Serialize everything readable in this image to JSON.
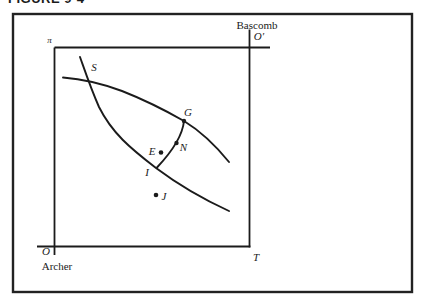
{
  "figure": {
    "caption": "FIGURE 9-4"
  },
  "colors": {
    "ink": "#1b1b1b",
    "background": "#ffffff"
  },
  "traders": {
    "top_right": "Bascomb",
    "bottom_left": "Archer"
  },
  "corner_labels": {
    "pi": "π",
    "o_prime": "O′",
    "o": "O",
    "t": "T"
  },
  "points": {
    "s": "S",
    "g": "G",
    "n": "N",
    "e": "E",
    "i": "I",
    "j": "J"
  }
}
